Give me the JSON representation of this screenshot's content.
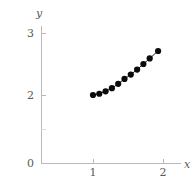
{
  "chart_data": {
    "type": "scatter",
    "title": "",
    "subtitle": "",
    "xlabel": "x",
    "ylabel": "y",
    "xlim": [
      0.6,
      2.1
    ],
    "ylim": [
      0,
      3.25
    ],
    "grid": false,
    "legend": null,
    "markers": "filled-circle",
    "connected": true,
    "x": [
      1.0,
      1.09,
      1.18,
      1.27,
      1.36,
      1.45,
      1.54,
      1.63,
      1.72,
      1.81,
      1.93
    ],
    "y": [
      2.0,
      2.02,
      2.06,
      2.11,
      2.18,
      2.26,
      2.33,
      2.41,
      2.5,
      2.59,
      2.71
    ],
    "series": [
      {
        "name": "data",
        "values": [
          2.0,
          2.02,
          2.06,
          2.11,
          2.18,
          2.26,
          2.33,
          2.41,
          2.5,
          2.59,
          2.71
        ]
      }
    ],
    "x_ticks": [
      {
        "value": 1,
        "label": "1"
      },
      {
        "value": 2,
        "label": "2"
      }
    ],
    "y_ticks": [
      {
        "value": 0,
        "label": "0"
      },
      {
        "value": 1,
        "label": ""
      },
      {
        "value": 2,
        "label": "2"
      },
      {
        "value": 3,
        "label": "3"
      }
    ],
    "colors": {
      "marker": "#0b0b0b",
      "line": "#2b2b2b",
      "axis": "#b9b9b9",
      "tick_text": "#5a5a5a",
      "background": "#ffffff"
    }
  },
  "axes": {
    "y_title": "y",
    "x_title": "x",
    "y_label_3": "3",
    "y_label_2": "2",
    "y_label_1": "",
    "y_label_0": "0",
    "x_label_1": "1",
    "x_label_2": "2"
  }
}
